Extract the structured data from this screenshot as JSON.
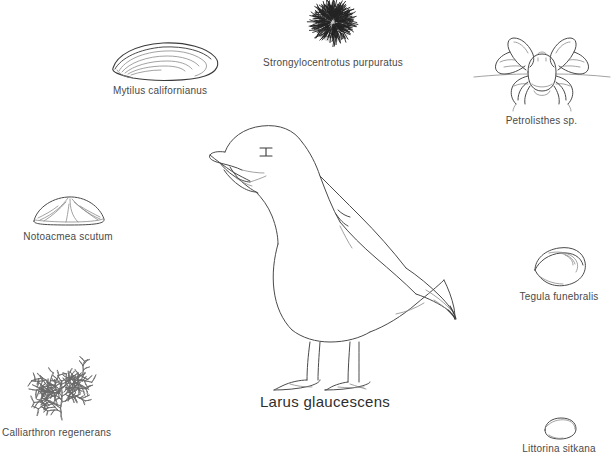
{
  "plate": {
    "title": "Larus glaucescens",
    "background_color": "#ffffff",
    "ink_color": "#4a4a4a",
    "width": 613,
    "height": 462
  },
  "main_subject": {
    "name": "glaucous-winged-gull",
    "label": "Larus glaucescens",
    "common_name": "gull",
    "orientation": "standing, facing left, beak open"
  },
  "organisms": [
    {
      "id": "mussel",
      "label": "Mytilus californianus",
      "icon": "mussel-shell",
      "position": "upper-left"
    },
    {
      "id": "urchin",
      "label": "Strongylocentrotus purpuratus",
      "icon": "sea-urchin",
      "position": "top-center"
    },
    {
      "id": "crab",
      "label": "Petrolisthes sp.",
      "icon": "porcelain-crab",
      "position": "upper-right"
    },
    {
      "id": "limpet",
      "label": "Notoacmea scutum",
      "icon": "limpet-shell",
      "position": "mid-left"
    },
    {
      "id": "turban-snail",
      "label": "Tegula funebralis",
      "icon": "turban-snail-shell",
      "position": "mid-right"
    },
    {
      "id": "coralline-alga",
      "label": "Calliarthron regenerans",
      "icon": "branching-alga",
      "position": "lower-left"
    },
    {
      "id": "periwinkle",
      "label": "Littorina sitkana",
      "icon": "periwinkle-shell",
      "position": "lower-right"
    }
  ]
}
